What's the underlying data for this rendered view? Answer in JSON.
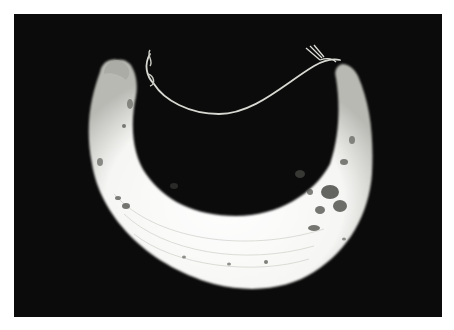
{
  "image": {
    "subject": "crescent shell pendant with cord",
    "background_color": "#0b0b0b",
    "border_color": "#ffffff",
    "shell_color": "#f4f4f2",
    "cord_color": "#d8d8d2"
  }
}
